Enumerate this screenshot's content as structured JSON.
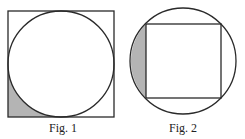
{
  "figures": [
    {
      "id": "fig1",
      "caption": "Fig. 1",
      "description": "Circle inscribed in a square; bottom-left corner region between square and circle is shaded",
      "square": {
        "x": 8,
        "y": 11,
        "size": 106
      },
      "circle": {
        "cx": 61,
        "cy": 64,
        "r": 53
      },
      "shaded_region": "bottom-left corner outside circle, inside square"
    },
    {
      "id": "fig2",
      "caption": "Fig. 2",
      "description": "Square inscribed in a circle; left circular segment between circle and square is shaded",
      "circle": {
        "cx": 183,
        "cy": 61,
        "r": 53
      },
      "square": {
        "x": 146,
        "y": 24,
        "size": 75
      },
      "shaded_region": "left segment outside square, inside circle"
    }
  ],
  "colors": {
    "stroke": "#2a2a2a",
    "shade": "#b4b4b4",
    "background": "#ffffff"
  }
}
